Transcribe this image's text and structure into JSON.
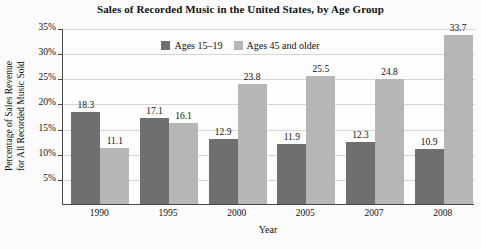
{
  "chart_data": {
    "type": "bar",
    "title": "Sales of Recorded Music in the United States, by Age Group",
    "xlabel": "Year",
    "ylabel_line1": "Percentage of Sales Revenue",
    "ylabel_line2": "for All Recorded Music Sold",
    "categories": [
      "1990",
      "1995",
      "2000",
      "2005",
      "2007",
      "2008"
    ],
    "series": [
      {
        "name": "Ages 15–19",
        "color": "#6f6f6f",
        "values": [
          18.3,
          17.1,
          12.9,
          11.9,
          12.3,
          10.9
        ],
        "labels": [
          "18.3",
          "17.1",
          "12.9",
          "11.9",
          "12.3",
          "10.9"
        ]
      },
      {
        "name": "Ages 45 and older",
        "color": "#b6b6b6",
        "values": [
          11.1,
          16.1,
          23.8,
          25.5,
          24.8,
          33.7
        ],
        "labels": [
          "11.1",
          "16.1",
          "23.8",
          "25.5",
          "24.8",
          "33.7"
        ]
      }
    ],
    "ylim": [
      0,
      35
    ],
    "yticks": [
      5,
      10,
      15,
      20,
      25,
      30,
      35
    ],
    "ytick_labels": [
      "5%",
      "10%",
      "15%",
      "20%",
      "25%",
      "30%",
      "35%"
    ],
    "grid": true,
    "legend_position": "top-center"
  }
}
